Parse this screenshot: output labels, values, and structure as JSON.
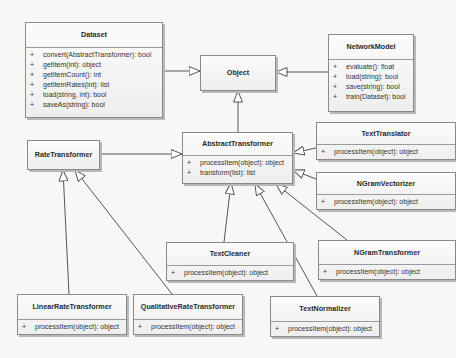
{
  "diagram": {
    "type": "UML class diagram",
    "classes": {
      "dataset": {
        "name": "Dataset",
        "members": [
          {
            "vis": "+",
            "sig": "convert(AbstractTransformer): bool"
          },
          {
            "vis": "+",
            "sig": "getItem(int): object"
          },
          {
            "vis": "+",
            "sig": "getItemCount(): int"
          },
          {
            "vis": "+",
            "sig": "getItemRates(int): list"
          },
          {
            "vis": "+",
            "sig": "load(string, int): bool"
          },
          {
            "vis": "+",
            "sig": "saveAs(string): bool"
          }
        ]
      },
      "object": {
        "name": "Object"
      },
      "network_model": {
        "name": "NetworkModel",
        "members": [
          {
            "vis": "+",
            "sig": "evaluate(): float"
          },
          {
            "vis": "+",
            "sig": "load(string): bool"
          },
          {
            "vis": "+",
            "sig": "save(string): bool"
          },
          {
            "vis": "+",
            "sig": "train(Dataset): bool"
          }
        ]
      },
      "rate_transformer": {
        "name": "RateTransformer"
      },
      "abstract_transformer": {
        "name": "AbstractTransformer",
        "members": [
          {
            "vis": "+",
            "sig": "processItem(object): object"
          },
          {
            "vis": "+",
            "sig": "transform(list): list"
          }
        ]
      },
      "text_translator": {
        "name": "TextTranslator",
        "members": [
          {
            "vis": "+",
            "sig": "processItem(object): object"
          }
        ]
      },
      "ngram_vectorizer": {
        "name": "NGramVectorizer",
        "members": [
          {
            "vis": "+",
            "sig": "processItem(object): object"
          }
        ]
      },
      "text_cleaner": {
        "name": "TextCleaner",
        "members": [
          {
            "vis": "+",
            "sig": "processItem(object): object"
          }
        ]
      },
      "ngram_transformer": {
        "name": "NGramTransformer",
        "members": [
          {
            "vis": "+",
            "sig": "processItem(object): object"
          }
        ]
      },
      "linear_rate_transformer": {
        "name": "LinearRateTransformer",
        "members": [
          {
            "vis": "+",
            "sig": "processItem(object): object"
          }
        ]
      },
      "qualitative_rate_transformer": {
        "name": "QualitativeRateTransformer",
        "members": [
          {
            "vis": "+",
            "sig": "processItem(object): object"
          }
        ]
      },
      "text_normalizer": {
        "name": "TextNormalizer",
        "members": [
          {
            "vis": "+",
            "sig": "processItem(object): object"
          }
        ]
      }
    },
    "relations": [
      {
        "from": "Dataset",
        "to": "Object",
        "kind": "generalization"
      },
      {
        "from": "NetworkModel",
        "to": "Object",
        "kind": "generalization"
      },
      {
        "from": "AbstractTransformer",
        "to": "Object",
        "kind": "generalization"
      },
      {
        "from": "RateTransformer",
        "to": "AbstractTransformer",
        "kind": "generalization"
      },
      {
        "from": "TextTranslator",
        "to": "AbstractTransformer",
        "kind": "generalization"
      },
      {
        "from": "NGramVectorizer",
        "to": "AbstractTransformer",
        "kind": "generalization"
      },
      {
        "from": "TextCleaner",
        "to": "AbstractTransformer",
        "kind": "generalization"
      },
      {
        "from": "TextNormalizer",
        "to": "AbstractTransformer",
        "kind": "generalization"
      },
      {
        "from": "NGramTransformer",
        "to": "AbstractTransformer",
        "kind": "generalization"
      },
      {
        "from": "LinearRateTransformer",
        "to": "RateTransformer",
        "kind": "generalization"
      },
      {
        "from": "QualitativeRateTransformer",
        "to": "RateTransformer",
        "kind": "generalization"
      }
    ],
    "colors": {
      "background": "#f7f7f5",
      "box_border": "#8a8a8a",
      "line": "#555555"
    }
  }
}
